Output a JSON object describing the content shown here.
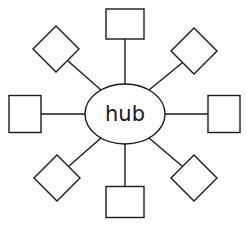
{
  "diagram": {
    "type": "star-topology",
    "hub": {
      "label": "hub",
      "shape": "ellipse"
    },
    "nodes": [
      {
        "id": "top",
        "shape": "square",
        "direction": "north",
        "label": ""
      },
      {
        "id": "top-right",
        "shape": "diamond",
        "direction": "north-east",
        "label": ""
      },
      {
        "id": "right",
        "shape": "square",
        "direction": "east",
        "label": ""
      },
      {
        "id": "bottom-right",
        "shape": "diamond",
        "direction": "south-east",
        "label": ""
      },
      {
        "id": "bottom",
        "shape": "square",
        "direction": "south",
        "label": ""
      },
      {
        "id": "bottom-left",
        "shape": "diamond",
        "direction": "south-west",
        "label": ""
      },
      {
        "id": "left",
        "shape": "square",
        "direction": "west",
        "label": ""
      },
      {
        "id": "top-left",
        "shape": "diamond",
        "direction": "north-west",
        "label": ""
      }
    ],
    "edges": [
      {
        "from": "hub",
        "to": "top"
      },
      {
        "from": "hub",
        "to": "top-right"
      },
      {
        "from": "hub",
        "to": "right"
      },
      {
        "from": "hub",
        "to": "bottom-right"
      },
      {
        "from": "hub",
        "to": "bottom"
      },
      {
        "from": "hub",
        "to": "bottom-left"
      },
      {
        "from": "hub",
        "to": "left"
      },
      {
        "from": "hub",
        "to": "top-left"
      }
    ],
    "colors": {
      "stroke": "#1a1a1a",
      "fill": "#ffffff"
    }
  }
}
